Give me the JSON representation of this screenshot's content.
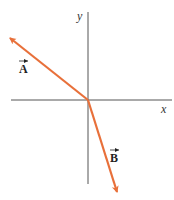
{
  "diagram": {
    "type": "vector-diagram",
    "axes": {
      "x_label": "x",
      "y_label": "y",
      "color": "#555555"
    },
    "vectors": [
      {
        "name": "A",
        "label": "A",
        "direction": "up-left",
        "color": "#e8703a"
      },
      {
        "name": "B",
        "label": "B",
        "direction": "down-right",
        "color": "#e8703a"
      }
    ]
  }
}
